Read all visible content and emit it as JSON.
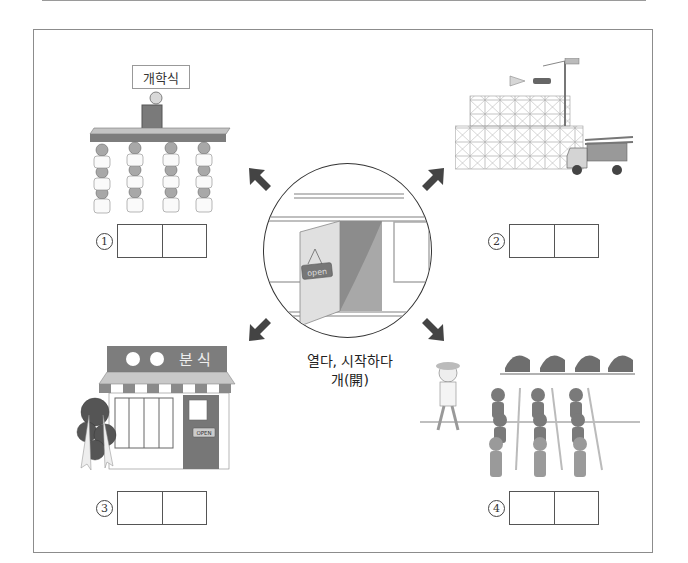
{
  "center": {
    "caption_line1": "열다, 시작하다",
    "caption_line2": "개(開)",
    "sign_text": "open"
  },
  "panels": [
    {
      "id": 1,
      "scene": "opening-ceremony",
      "label_sign": "개학식",
      "number": "1"
    },
    {
      "id": 2,
      "scene": "construction-scaffolding",
      "number": "2"
    },
    {
      "id": 3,
      "scene": "snack-shop-opening",
      "shop_sign": "분 식",
      "door_sign": "OPEN",
      "number": "3"
    },
    {
      "id": 4,
      "scene": "amusement-ride-line",
      "number": "4"
    }
  ],
  "arrows": [
    "arrow-up-left",
    "arrow-up-right",
    "arrow-down-left",
    "arrow-down-right"
  ],
  "colors": {
    "frame": "#8c8c8c",
    "fill_dark": "#6e6e6e",
    "fill_mid": "#9e9e9e",
    "fill_light": "#d2d2d2"
  }
}
